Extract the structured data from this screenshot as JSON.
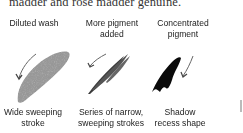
{
  "paragraph": {
    "text_fragment": "madder and rose madder genuine."
  },
  "figure": {
    "columns": [
      {
        "title_line1": "Diluted wash",
        "title_line2": "",
        "caption_line1": "Wide sweeping",
        "caption_line2": "stroke",
        "illustration": "diluted-wash-stroke",
        "tone": "#8a8a8a"
      },
      {
        "title_line1": "More pigment",
        "title_line2": "added",
        "caption_line1": "Series of narrow,",
        "caption_line2": "sweeping strokes",
        "illustration": "narrow-strokes",
        "tone": "#444444"
      },
      {
        "title_line1": "Concentrated",
        "title_line2": "pigment",
        "caption_line1": "Shadow",
        "caption_line2": "recess shape",
        "illustration": "shadow-recess-shape",
        "tone": "#0a0a0a"
      }
    ],
    "arrow_color": "#666666"
  }
}
